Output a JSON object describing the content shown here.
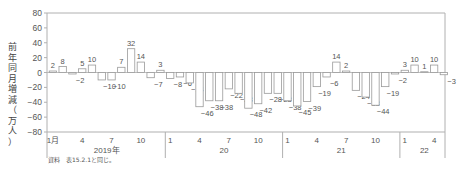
{
  "chart_data": {
    "type": "bar",
    "title": "",
    "ylabel": "前年同月増減（万人）",
    "xlabel": "",
    "ylim": [
      -80,
      80
    ],
    "yticks": [
      80,
      60,
      40,
      20,
      0,
      -20,
      -40,
      -60,
      -80
    ],
    "grid": false,
    "legend": null,
    "years": [
      {
        "label": "2019年",
        "month_ticks": [
          "1月",
          "4",
          "7",
          "10"
        ],
        "values": [
          2,
          8,
          -2,
          5,
          10,
          -10,
          -10,
          7,
          32,
          14,
          -7,
          3
        ]
      },
      {
        "label": "20",
        "month_ticks": [
          "1",
          "4",
          "7",
          "10"
        ],
        "values": [
          -8,
          -6,
          -14,
          -46,
          -38,
          -38,
          -22,
          -28,
          -48,
          -42,
          -28,
          -28
        ]
      },
      {
        "label": "21",
        "month_ticks": [
          "1",
          "4",
          "7",
          "10"
        ],
        "values": [
          -38,
          -45,
          -39,
          -19,
          -6,
          14,
          2,
          -24,
          -33,
          -44,
          -19,
          -2
        ]
      },
      {
        "label": "22",
        "month_ticks": [
          "1",
          "4"
        ],
        "values": [
          3,
          10,
          1,
          10,
          -3
        ]
      }
    ]
  },
  "ylabel_chars": [
    "前",
    "年",
    "同",
    "月",
    "増",
    "減",
    "（",
    "万",
    "人",
    "）"
  ],
  "source_note": "資料　表15.2.1と同じ。",
  "colors": {
    "axis": "#b0b0b0",
    "bar_stroke": "#9a9a9a",
    "text": "#555555"
  }
}
